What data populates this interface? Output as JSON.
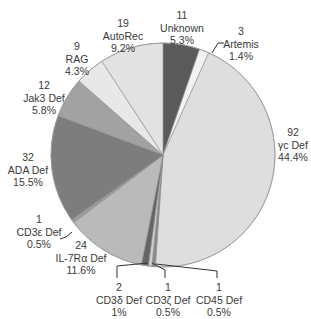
{
  "chart_data": {
    "type": "pie",
    "title": "",
    "start_angle_deg": 0,
    "direction": "clockwise",
    "center": [
      163,
      155
    ],
    "radius": 112,
    "slices": [
      {
        "label": "Unknown",
        "count": "11",
        "pct": "5.3%",
        "value": 5.3,
        "color": "#5a5a5a"
      },
      {
        "label": "Artemis",
        "count": "3",
        "pct": "1.4%",
        "value": 1.4,
        "color": "#f2f2f2"
      },
      {
        "label": "γc Def",
        "count": "92",
        "pct": "44.4%",
        "value": 44.4,
        "color": "#dedede"
      },
      {
        "label": "CD45 Def",
        "count": "1",
        "pct": "0.5%",
        "value": 0.5,
        "color": "#8a8a8a"
      },
      {
        "label": "CD3ζ Def",
        "count": "1",
        "pct": "0.5%",
        "value": 0.5,
        "color": "#cfcfcf"
      },
      {
        "label": "CD3δ Def",
        "count": "2",
        "pct": "1%",
        "value": 1.0,
        "color": "#666666"
      },
      {
        "label": "IL-7Rα Def",
        "count": "24",
        "pct": "11.6%",
        "value": 11.6,
        "color": "#bababa"
      },
      {
        "label": "CD3ε Def",
        "count": "1",
        "pct": "0.5%",
        "value": 0.5,
        "color": "#9a9a9a"
      },
      {
        "label": "ADA Def",
        "count": "32",
        "pct": "15.5%",
        "value": 15.5,
        "color": "#7d7d7d"
      },
      {
        "label": "Jak3 Def",
        "count": "12",
        "pct": "5.8%",
        "value": 5.8,
        "color": "#a2a2a2"
      },
      {
        "label": "RAG",
        "count": "9",
        "pct": "4.3%",
        "value": 4.3,
        "color": "#e8e8e8"
      },
      {
        "label": "AutoRec",
        "count": "19",
        "pct": "9.2%",
        "value": 9.2,
        "color": "#e2e2e2"
      }
    ]
  },
  "labels": [
    {
      "count": "11",
      "name": "Unknown",
      "pct": "5.3%",
      "x": 182,
      "y": 9
    },
    {
      "count": "3",
      "name": "Artemis",
      "pct": "1.4%",
      "x": 241,
      "y": 25
    },
    {
      "count": "92",
      "name": "γc Def",
      "pct": "44.4%",
      "x": 293,
      "y": 126
    },
    {
      "count": "1",
      "name": "CD45 Def",
      "pct": "0.5%",
      "x": 219,
      "y": 281
    },
    {
      "count": "1",
      "name": "CD3ζ Def",
      "pct": "0.5%",
      "x": 168,
      "y": 281
    },
    {
      "count": "2",
      "name": "CD3δ Def",
      "pct": "1%",
      "x": 119,
      "y": 281
    },
    {
      "count": "24",
      "name": "IL-7Rα Def",
      "pct": "11.6%",
      "x": 81,
      "y": 239
    },
    {
      "count": "1",
      "name": "CD3ε Def",
      "pct": "0.5%",
      "x": 39,
      "y": 213
    },
    {
      "count": "32",
      "name": "ADA Def",
      "pct": "15.5%",
      "x": 28,
      "y": 151
    },
    {
      "count": "12",
      "name": "Jak3 Def",
      "pct": "5.8%",
      "x": 44,
      "y": 79
    },
    {
      "count": "9",
      "name": "RAG",
      "pct": "4.3%",
      "x": 77,
      "y": 40
    },
    {
      "count": "19",
      "name": "AutoRec",
      "pct": "9.2%",
      "x": 123,
      "y": 17
    }
  ]
}
